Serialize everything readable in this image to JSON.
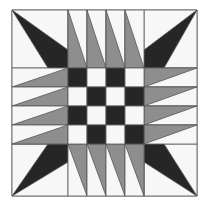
{
  "image": {
    "description": "Quilt block: 4x4 checkerboard center with radiating gray triangle strips and dark corner spikes",
    "colors": {
      "background": "#ffffff",
      "light": "#f7f7f7",
      "gray": "#8e8e8e",
      "dark": "#262626",
      "line": "#555555"
    },
    "frame": {
      "x0": 12,
      "y0": 10,
      "x1": 197,
      "y1": 196
    },
    "inner": {
      "x0": 68,
      "y0": 68,
      "x1": 144,
      "y1": 144,
      "cell": 19
    },
    "checkerboard": [
      [
        "dark",
        "light",
        "dark",
        "light"
      ],
      [
        "light",
        "dark",
        "light",
        "dark"
      ],
      [
        "dark",
        "light",
        "dark",
        "light"
      ],
      [
        "light",
        "dark",
        "light",
        "dark"
      ]
    ]
  }
}
